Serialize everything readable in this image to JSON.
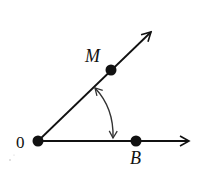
{
  "diagram": {
    "type": "angle",
    "vertex": {
      "label": "0",
      "x": 38,
      "y": 141
    },
    "points": [
      {
        "label": "M",
        "x": 111,
        "y": 70,
        "on_ray": "OM"
      },
      {
        "label": "B",
        "x": 136,
        "y": 141,
        "on_ray": "OB"
      }
    ],
    "rays": [
      {
        "name": "OM",
        "from": [
          38,
          141
        ],
        "to": [
          152,
          31
        ]
      },
      {
        "name": "OB",
        "from": [
          38,
          141
        ],
        "to": [
          190,
          141
        ]
      }
    ],
    "arc": {
      "from": [
        95,
        87
      ],
      "to": [
        113,
        139
      ],
      "arrows": "both"
    },
    "colors": {
      "stroke": "#111111",
      "background": "#ffffff"
    }
  },
  "labels": {
    "vertex": "0",
    "m": "M",
    "b": "B"
  }
}
